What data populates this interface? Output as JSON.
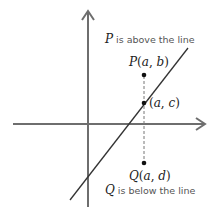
{
  "diagram": {
    "type": "coordinate-plane",
    "annotations": {
      "above": {
        "var": "P",
        "text": " is above the line"
      },
      "below": {
        "var": "Q",
        "text": " is below the line"
      }
    },
    "points": {
      "P": {
        "name": "P",
        "open": "(",
        "x": "a",
        "sep": ", ",
        "y": "b",
        "close": ")"
      },
      "M": {
        "open": "(",
        "x": "a",
        "sep": ", ",
        "y": "c",
        "close": ")"
      },
      "Q": {
        "name": "Q",
        "open": "(",
        "x": "a",
        "sep": ", ",
        "y": "d",
        "close": ")"
      }
    },
    "colors": {
      "axis": "#6e6e6e",
      "line": "#333333",
      "dashed": "#777777",
      "dot": "#111111"
    }
  }
}
